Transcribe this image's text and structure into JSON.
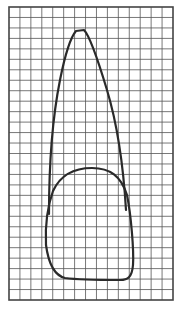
{
  "figure": {
    "grid": {
      "x0": 9,
      "y0": 7,
      "x1": 173,
      "y1": 300,
      "columns": 15,
      "rows": 28,
      "line_color": "#555555",
      "border_color": "#444444"
    },
    "outline_color": "#2a2a2a",
    "outline_width": 2.2,
    "shapes": [
      {
        "name": "root-outline",
        "label": "Root"
      },
      {
        "name": "crown-outline",
        "label": "Crown"
      }
    ]
  }
}
